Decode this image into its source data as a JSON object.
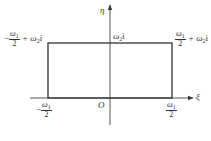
{
  "diagram": {
    "type": "complex-plane-rectangle",
    "axes": {
      "horizontal_label": "ξ",
      "vertical_label": "η",
      "origin_label": "O"
    },
    "corners": {
      "top_left": {
        "sign": "−",
        "numerator": "ω",
        "num_sub": "1",
        "denominator": "2",
        "suffix": "+ ω",
        "suffix_sub": "2",
        "unit": "i"
      },
      "top_right": {
        "sign": "",
        "numerator": "ω",
        "num_sub": "1",
        "denominator": "2",
        "suffix": "+ ω",
        "suffix_sub": "2",
        "unit": "i"
      },
      "top_middle": {
        "base": "ω",
        "sub": "2",
        "unit": "i"
      },
      "bottom_left": {
        "sign": "−",
        "numerator": "ω",
        "num_sub": "1",
        "denominator": "2"
      },
      "bottom_right": {
        "numerator": "ω",
        "num_sub": "1",
        "denominator": "2"
      }
    },
    "colors": {
      "line": "#333333",
      "background": "#ffffff"
    }
  }
}
